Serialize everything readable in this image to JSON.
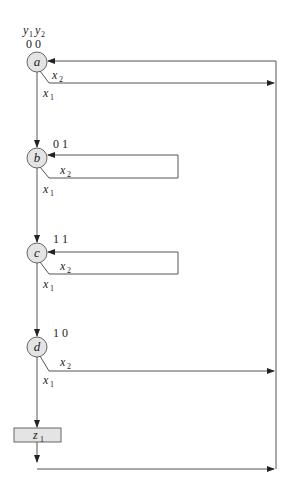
{
  "header": {
    "var1": "y",
    "var1_sub": "1",
    "var2": "y",
    "var2_sub": "2"
  },
  "states": [
    {
      "name": "a",
      "code": "0 0"
    },
    {
      "name": "b",
      "code": "0 1"
    },
    {
      "name": "c",
      "code": "1 1"
    },
    {
      "name": "d",
      "code": "1 0"
    }
  ],
  "branch_labels": {
    "x1": "x",
    "x1_sub": "1",
    "x2": "x",
    "x2_sub": "2"
  },
  "output": {
    "var": "z",
    "sub": "1"
  },
  "colors": {
    "state_fill": "#e4e4e4",
    "line": "#555555"
  }
}
